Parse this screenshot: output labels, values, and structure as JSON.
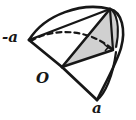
{
  "figure": {
    "kind": "geometry-solid-diagram",
    "labels": {
      "left_vertex": "-a",
      "origin_vertex": "O",
      "bottom_vertex": "a"
    },
    "marks": {
      "right_angle": "right-angle-square"
    },
    "colors": {
      "stroke": "#171717",
      "shaded_face": "#d0d0d0",
      "background": "#ffffff"
    }
  }
}
